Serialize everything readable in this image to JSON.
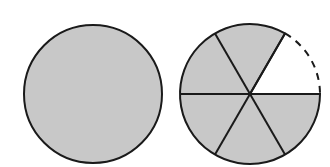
{
  "diagram": {
    "colors": {
      "fill": "#c8c8c8",
      "stroke": "#1a1a1a",
      "background": "#ffffff"
    },
    "whole_circle": {
      "cx": 93,
      "cy": 94,
      "r": 69
    },
    "divided_circle": {
      "cx": 250,
      "cy": 94,
      "r": 70,
      "total_parts": 6,
      "shaded_parts": 5,
      "missing_part": "upper-right sector (0° to 60°), dashed arc"
    }
  }
}
